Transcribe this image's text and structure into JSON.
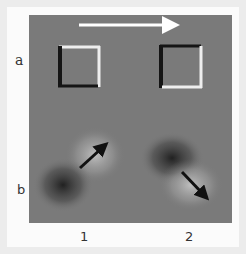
{
  "figure": {
    "row_labels": [
      "a",
      "b"
    ],
    "column_labels": [
      "1",
      "2"
    ],
    "motion_arrow": {
      "direction": "right",
      "color": "#ffffff"
    },
    "row_a": {
      "description": "embossed squares illustrating shading-derived relief",
      "squares": [
        {
          "column": "1",
          "dark_edges": [
            "left",
            "bottom"
          ],
          "light_edges": [
            "top",
            "right"
          ]
        },
        {
          "column": "2",
          "dark_edges": [
            "left",
            "top"
          ],
          "light_edges": [
            "right",
            "bottom"
          ]
        }
      ]
    },
    "row_b": {
      "description": "blurred light/dark blob pairs with arrows",
      "arrows": [
        {
          "column": "1",
          "direction": "up-right",
          "color": "#111111"
        },
        {
          "column": "2",
          "direction": "down-right",
          "color": "#111111"
        }
      ]
    },
    "colors": {
      "background": "#ececec",
      "card": "#fbfbfb",
      "panel": "#7a7a7a",
      "edge_dark": "#151515",
      "edge_light": "#f0f0f0"
    }
  }
}
